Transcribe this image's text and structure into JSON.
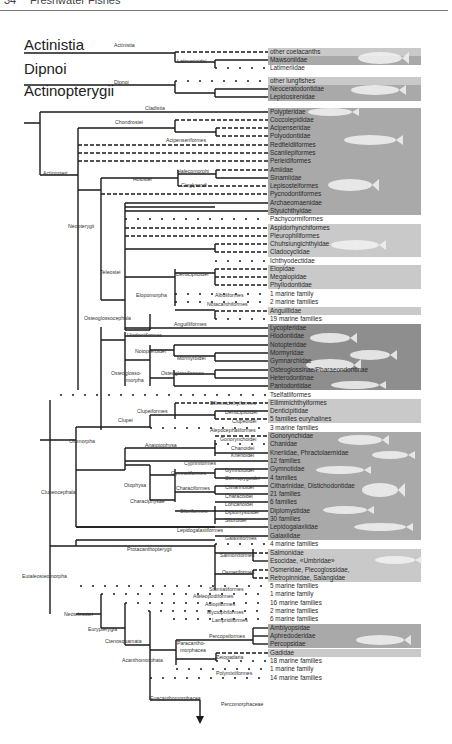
{
  "page": {
    "number": "34",
    "running_title": "Freshwater Fishes"
  },
  "colors": {
    "line": "#1a1a1a",
    "panel_light": "#c9c9c9",
    "panel_mid": "#a9a9a9",
    "panel_dark": "#8e8e8e",
    "fish": "#f2f2f2"
  },
  "groups": [
    {
      "label": "Actinistia",
      "x": 24,
      "y": 58
    },
    {
      "label": "Dipnoi",
      "x": 24,
      "y": 82
    },
    {
      "label": "Actinopterygii",
      "x": 24,
      "y": 104
    }
  ],
  "nodes": [
    {
      "label": "Actinistia",
      "x": 114,
      "y": 47
    },
    {
      "label": "Latimerioidei",
      "x": 177,
      "y": 63
    },
    {
      "label": "Dipnoi",
      "x": 114,
      "y": 84
    },
    {
      "label": "Cladistia",
      "x": 145,
      "y": 110
    },
    {
      "label": "Chondrostei",
      "x": 115,
      "y": 124
    },
    {
      "label": "Acipenseriformes",
      "x": 166,
      "y": 142
    },
    {
      "label": "Actinopteri",
      "x": 43,
      "y": 175
    },
    {
      "label": "Holostei",
      "x": 133,
      "y": 181
    },
    {
      "label": "Halecomorphi",
      "x": 177,
      "y": 173
    },
    {
      "label": "Ginglymodi",
      "x": 181,
      "y": 187
    },
    {
      "label": "Neopterygii",
      "x": 68,
      "y": 228
    },
    {
      "label": "Teleostei",
      "x": 100,
      "y": 274
    },
    {
      "label": "Denticipitoidei",
      "x": 176,
      "y": 276
    },
    {
      "label": "Elopomorpha",
      "x": 136,
      "y": 297
    },
    {
      "label": "Albuliformes",
      "x": 215,
      "y": 297
    },
    {
      "label": "Notacanthiformes",
      "x": 207,
      "y": 306
    },
    {
      "label": "Osteoglossocephala",
      "x": 84,
      "y": 320
    },
    {
      "label": "Anguilliformes",
      "x": 174,
      "y": 326
    },
    {
      "label": "Hiodontiformes",
      "x": 127,
      "y": 337
    },
    {
      "label": "Notopteroidei",
      "x": 135,
      "y": 353
    },
    {
      "label": "Mormyroidei",
      "x": 177,
      "y": 360
    },
    {
      "label": "Osteoglosso-",
      "x": 111,
      "y": 375
    },
    {
      "label": "morpha",
      "x": 126,
      "y": 382
    },
    {
      "label": "Osteoglossiformes",
      "x": 161,
      "y": 375
    },
    {
      "label": "Ellimmichthyiformes",
      "x": 210,
      "y": 405
    },
    {
      "label": "Clupeiformes",
      "x": 137,
      "y": 413
    },
    {
      "label": "Denticipitoidei",
      "x": 225,
      "y": 414
    },
    {
      "label": "Clupei",
      "x": 118,
      "y": 422
    },
    {
      "label": "Clupeoidei",
      "x": 232,
      "y": 423
    },
    {
      "label": "Alepocephaliformes",
      "x": 210,
      "y": 432
    },
    {
      "label": "Gonorynchoidei",
      "x": 220,
      "y": 441
    },
    {
      "label": "Otomorpha",
      "x": 69,
      "y": 443
    },
    {
      "label": "Anatotophysa",
      "x": 145,
      "y": 447
    },
    {
      "label": "Chanoidei",
      "x": 231,
      "y": 450
    },
    {
      "label": "Knerioidei",
      "x": 231,
      "y": 457
    },
    {
      "label": "Cypriniformes",
      "x": 184,
      "y": 465
    },
    {
      "label": "Gymnotoidei",
      "x": 225,
      "y": 472
    },
    {
      "label": "Gymnotiformes",
      "x": 171,
      "y": 475
    },
    {
      "label": "Sternopygoidei",
      "x": 225,
      "y": 480
    },
    {
      "label": "Otophysa",
      "x": 124,
      "y": 487
    },
    {
      "label": "Characiformes",
      "x": 176,
      "y": 490
    },
    {
      "label": "Citharinoidei",
      "x": 225,
      "y": 489
    },
    {
      "label": "Characoidei",
      "x": 225,
      "y": 498
    },
    {
      "label": "Characiphysae",
      "x": 130,
      "y": 503
    },
    {
      "label": "Loricarioidei",
      "x": 225,
      "y": 506
    },
    {
      "label": "Siluriformes",
      "x": 180,
      "y": 513
    },
    {
      "label": "Diplomystoidei",
      "x": 225,
      "y": 514
    },
    {
      "label": "Siluroidei",
      "x": 225,
      "y": 522
    },
    {
      "label": "Clupeocephala",
      "x": 41,
      "y": 494
    },
    {
      "label": "Lepidogalaxiiformes",
      "x": 177,
      "y": 532
    },
    {
      "label": "Galaxiiformes",
      "x": 225,
      "y": 540
    },
    {
      "label": "Protacanthopterygii",
      "x": 127,
      "y": 551
    },
    {
      "label": "Salmoniformes",
      "x": 220,
      "y": 557
    },
    {
      "label": "Eutaleosteomorpha",
      "x": 22,
      "y": 578
    },
    {
      "label": "Osmeriformes",
      "x": 222,
      "y": 574
    },
    {
      "label": "Stomiatiformes",
      "x": 209,
      "y": 591
    },
    {
      "label": "Ateleopodiformes",
      "x": 193,
      "y": 598
    },
    {
      "label": "Aulopiformes",
      "x": 205,
      "y": 606
    },
    {
      "label": "Neoteleostei",
      "x": 64,
      "y": 616
    },
    {
      "label": "Myctophiformes",
      "x": 207,
      "y": 614
    },
    {
      "label": "Lampridiformes",
      "x": 212,
      "y": 622
    },
    {
      "label": "Eurypterygia",
      "x": 88,
      "y": 631
    },
    {
      "label": "Ctenosquamata",
      "x": 105,
      "y": 643
    },
    {
      "label": "Percopsiformes",
      "x": 209,
      "y": 638
    },
    {
      "label": "Paracantho-",
      "x": 177,
      "y": 645
    },
    {
      "label": "morphacea",
      "x": 180,
      "y": 652
    },
    {
      "label": "Acanthomorphata",
      "x": 122,
      "y": 662
    },
    {
      "label": "Zeiogadaria",
      "x": 216,
      "y": 659
    },
    {
      "label": "Polymixiiformes",
      "x": 216,
      "y": 675
    },
    {
      "label": "Euacanthomorphacea",
      "x": 150,
      "y": 700
    }
  ],
  "terminal_arrow": {
    "label": "Percomorphaceae",
    "x": 221,
    "y": 706
  },
  "tips": [
    {
      "label": "other coelacanths",
      "y": 52,
      "line": "dashed",
      "x0": 175
    },
    {
      "label": "Mawsoniidae",
      "y": 60,
      "line": "solid",
      "x0": 215
    },
    {
      "label": "Latimeriidae",
      "y": 68,
      "line": "dotted",
      "x0": 215
    },
    {
      "label": "other lungfishes",
      "y": 81,
      "line": "dotted",
      "x0": 175
    },
    {
      "label": "Neoceratodontidae",
      "y": 89,
      "line": "solid",
      "x0": 215
    },
    {
      "label": "Lepidosirenidae",
      "y": 97,
      "line": "solid",
      "x0": 215
    },
    {
      "label": "Polypteridae",
      "y": 112,
      "line": "solid",
      "x0": 40
    },
    {
      "label": "Coccolepididae",
      "y": 120,
      "line": "dashed",
      "x0": 175
    },
    {
      "label": "Acipenseridae",
      "y": 128,
      "line": "dashed",
      "x0": 216
    },
    {
      "label": "Polyodontidae",
      "y": 136,
      "line": "dashed",
      "x0": 216
    },
    {
      "label": "Redfieldiiformes",
      "y": 145,
      "line": "dashed",
      "x0": 78
    },
    {
      "label": "Scanilepiformes",
      "y": 153,
      "line": "dashed",
      "x0": 78
    },
    {
      "label": "Perleidiformes",
      "y": 161,
      "line": "dashed",
      "x0": 78
    },
    {
      "label": "Amiidae",
      "y": 170,
      "line": "dashed",
      "x0": 216
    },
    {
      "label": "Sinamiidae",
      "y": 178,
      "line": "solid",
      "x0": 216
    },
    {
      "label": "Lepisosteiformes",
      "y": 186,
      "line": "dashed",
      "x0": 178
    },
    {
      "label": "Pycnodontiformes",
      "y": 194,
      "line": "dashed",
      "x0": 101
    },
    {
      "label": "Archaeomaenidae",
      "y": 203,
      "line": "solid",
      "x0": 125
    },
    {
      "label": "Styuichthyidae",
      "y": 211,
      "line": "solid",
      "x0": 125
    },
    {
      "label": "Pachycormiformes",
      "y": 219,
      "line": "dotted",
      "x0": 125
    },
    {
      "label": "Aspidorhynchiformes",
      "y": 228,
      "line": "dashed",
      "x0": 125
    },
    {
      "label": "Pleurophiliformes",
      "y": 236,
      "line": "dashed",
      "x0": 125
    },
    {
      "label": "Chuhsiungichthyidae",
      "y": 244,
      "line": "dashed",
      "x0": 215
    },
    {
      "label": "Cladocyclidae",
      "y": 252,
      "line": "dashed",
      "x0": 215
    },
    {
      "label": "Ichthyodectidae",
      "y": 261,
      "line": "dotted",
      "x0": 215
    },
    {
      "label": "Elopidae",
      "y": 269,
      "line": "dashed",
      "x0": 215
    },
    {
      "label": "Megalopidae",
      "y": 277,
      "line": "dashed",
      "x0": 215
    },
    {
      "label": "Phyllodontidae",
      "y": 285,
      "line": "dashed",
      "x0": 215
    },
    {
      "label": "1 marine family",
      "y": 294,
      "line": "dotted",
      "x0": 175
    },
    {
      "label": "2 marine families",
      "y": 302,
      "line": "dotted",
      "x0": 175
    },
    {
      "label": "Anguillidae",
      "y": 311,
      "line": "dashed",
      "x0": 215
    },
    {
      "label": "19 marine families",
      "y": 319,
      "line": "dotted",
      "x0": 215
    },
    {
      "label": "Lycopteridae",
      "y": 328,
      "line": "solid",
      "x0": 125
    },
    {
      "label": "Hiodontidae",
      "y": 336,
      "line": "solid",
      "x0": 125
    },
    {
      "label": "Notopteridae",
      "y": 345,
      "line": "solid",
      "x0": 174
    },
    {
      "label": "Mormyridae",
      "y": 353,
      "line": "solid",
      "x0": 215
    },
    {
      "label": "Gymnarchidae",
      "y": 361,
      "line": "solid",
      "x0": 215
    },
    {
      "label": "Osteoglossinae/Pharaeondontinae",
      "y": 370,
      "line": "solid",
      "x0": 215
    },
    {
      "label": "Heterodontinae",
      "y": 378,
      "line": "solid",
      "x0": 215
    },
    {
      "label": "Pantodontidae",
      "y": 386,
      "line": "solid",
      "x0": 174
    },
    {
      "label": "Tselfatiiformes",
      "y": 395,
      "line": "dotted",
      "x0": 60
    },
    {
      "label": "Ellimmichthyiformes",
      "y": 403,
      "line": "dashed",
      "x0": 175
    },
    {
      "label": "Denticipitidae",
      "y": 411,
      "line": "solid",
      "x0": 215
    },
    {
      "label": "5 families euryhalines",
      "y": 419,
      "line": "dashed",
      "x0": 215
    },
    {
      "label": "3 marine families",
      "y": 428,
      "line": "dotted",
      "x0": 150
    },
    {
      "label": "Gonorynchidae",
      "y": 436,
      "line": "dashed",
      "x0": 215
    },
    {
      "label": "Chanidae",
      "y": 444,
      "line": "dotted",
      "x0": 215
    },
    {
      "label": "Kneriidae, Phractolaemidae",
      "y": 453,
      "line": "solid",
      "x0": 215
    },
    {
      "label": "12 families",
      "y": 461,
      "line": "solid",
      "x0": 125
    },
    {
      "label": "Gymnotidae",
      "y": 469,
      "line": "solid",
      "x0": 215
    },
    {
      "label": "4 families",
      "y": 478,
      "line": "solid",
      "x0": 215
    },
    {
      "label": "Citharinidae, Distichodontidae",
      "y": 486,
      "line": "solid",
      "x0": 215
    },
    {
      "label": "21 families",
      "y": 494,
      "line": "solid",
      "x0": 215
    },
    {
      "label": "6 families",
      "y": 502,
      "line": "solid",
      "x0": 215
    },
    {
      "label": "Diplomystidae",
      "y": 511,
      "line": "solid",
      "x0": 215
    },
    {
      "label": "30 families",
      "y": 519,
      "line": "solid",
      "x0": 215
    },
    {
      "label": "Lepidogalaxiidae",
      "y": 527,
      "line": "solid",
      "x0": 76
    },
    {
      "label": "Galaxiidae",
      "y": 536,
      "line": "solid",
      "x0": 215
    },
    {
      "label": "4 marine families",
      "y": 544,
      "line": "dotted",
      "x0": 215
    },
    {
      "label": "Salmonidae",
      "y": 553,
      "line": "dashed",
      "x0": 253
    },
    {
      "label": "Esocidae, «Umbridae»",
      "y": 561,
      "line": "solid",
      "x0": 253
    },
    {
      "label": "Osmeridae, Plecoglossidae,",
      "y": 570,
      "line": "dashed",
      "x0": 253
    },
    {
      "label": "Retropinnidae, Salangidae",
      "y": 578,
      "line": "dashed",
      "x0": 253
    },
    {
      "label": "5 marine families",
      "y": 586,
      "line": "dotted",
      "x0": 80
    },
    {
      "label": "1 marine family",
      "y": 594,
      "line": "dotted",
      "x0": 101
    },
    {
      "label": "16 marine families",
      "y": 603,
      "line": "dotted",
      "x0": 125
    },
    {
      "label": "2 marine families",
      "y": 611,
      "line": "dotted",
      "x0": 148
    },
    {
      "label": "6 marine families",
      "y": 619,
      "line": "dotted",
      "x0": 173
    },
    {
      "label": "Amblyopsidae",
      "y": 628,
      "line": "solid",
      "x0": 253
    },
    {
      "label": "Aphredoderidae",
      "y": 636,
      "line": "solid",
      "x0": 253
    },
    {
      "label": "Percopsidae",
      "y": 644,
      "line": "solid",
      "x0": 253
    },
    {
      "label": "Gadidae",
      "y": 653,
      "line": "dashed",
      "x0": 216
    },
    {
      "label": "18 marine families",
      "y": 661,
      "line": "dotted",
      "x0": 216
    },
    {
      "label": "1 marine family",
      "y": 669,
      "line": "dotted",
      "x0": 176
    },
    {
      "label": "14 marine families",
      "y": 678,
      "line": "dotted",
      "x0": 150
    }
  ],
  "panels": [
    {
      "y": 48,
      "h": 9,
      "tone": "panel_light"
    },
    {
      "y": 56,
      "h": 9,
      "tone": "panel_mid"
    },
    {
      "y": 77,
      "h": 9,
      "tone": "panel_light"
    },
    {
      "y": 85,
      "h": 16,
      "tone": "panel_mid"
    },
    {
      "y": 108,
      "h": 107,
      "tone": "panel_mid"
    },
    {
      "y": 224,
      "h": 33,
      "tone": "panel_light"
    },
    {
      "y": 265,
      "h": 24,
      "tone": "panel_light"
    },
    {
      "y": 307,
      "h": 8,
      "tone": "panel_light"
    },
    {
      "y": 324,
      "h": 66,
      "tone": "panel_dark"
    },
    {
      "y": 399,
      "h": 24,
      "tone": "panel_light"
    },
    {
      "y": 432,
      "h": 108,
      "tone": "panel_mid"
    },
    {
      "y": 549,
      "h": 33,
      "tone": "panel_light"
    },
    {
      "y": 624,
      "h": 24,
      "tone": "panel_mid"
    },
    {
      "y": 649,
      "h": 8,
      "tone": "panel_light"
    }
  ]
}
